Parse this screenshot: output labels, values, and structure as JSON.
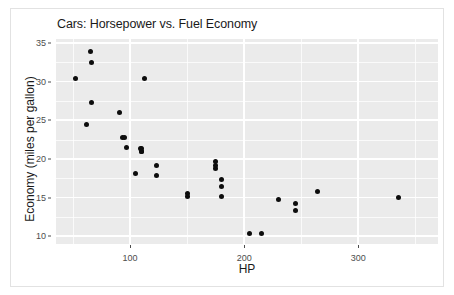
{
  "figure": {
    "title": "Cars: Horsepower vs. Fuel Economy",
    "background_color": "#ffffff",
    "panel_color": "#ebebeb",
    "grid_color": "#ffffff",
    "point_color": "#0d0d0d",
    "border_color": "#e2e2e2"
  },
  "chart_data": {
    "type": "scatter",
    "title": "Cars: Horsepower vs. Fuel Economy",
    "xlabel": "HP",
    "ylabel": "Economy (miles per gallon)",
    "xlim": [
      35,
      370
    ],
    "ylim": [
      9.0,
      35.5
    ],
    "xticks": [
      100,
      200,
      300
    ],
    "xtick_labels": [
      "100",
      "200",
      "300"
    ],
    "xticks_minor": [
      50,
      150,
      250,
      350
    ],
    "yticks": [
      10,
      15,
      20,
      25,
      30,
      35
    ],
    "ytick_labels": [
      "10",
      "15",
      "20",
      "25",
      "30",
      "35"
    ],
    "yticks_minor": [
      12.5,
      17.5,
      22.5,
      27.5,
      32.5
    ],
    "grid": true,
    "legend": null,
    "marker": "filled-circle",
    "marker_size_px": 5,
    "series": [
      {
        "name": "cars",
        "x": [
          110,
          110,
          93,
          110,
          175,
          105,
          245,
          62,
          95,
          123,
          123,
          180,
          180,
          180,
          205,
          215,
          230,
          66,
          52,
          65,
          97,
          150,
          150,
          245,
          175,
          66,
          91,
          113,
          264,
          175,
          335,
          109
        ],
        "y": [
          21.0,
          21.0,
          22.8,
          21.4,
          18.7,
          18.1,
          14.3,
          24.4,
          22.8,
          19.2,
          17.8,
          16.4,
          17.3,
          15.2,
          10.4,
          10.4,
          14.7,
          32.4,
          30.4,
          33.9,
          21.5,
          15.5,
          15.2,
          13.3,
          19.2,
          27.3,
          26.0,
          30.4,
          15.8,
          19.7,
          15.0,
          21.4
        ]
      }
    ]
  }
}
